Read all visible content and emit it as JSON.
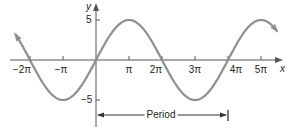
{
  "chart_data": {
    "type": "line",
    "title": "",
    "function": "y = 5 sin(x/2)",
    "xlabel": "x",
    "ylabel": "y",
    "x_ticks": [
      "-2π",
      "-π",
      "π",
      "2π",
      "3π",
      "4π",
      "5π"
    ],
    "x_tick_values_in_pi": [
      -2,
      -1,
      1,
      2,
      3,
      4,
      5
    ],
    "y_ticks": [
      "5",
      "-5"
    ],
    "y_tick_values": [
      5,
      -5
    ],
    "xlim_in_pi": [
      -2.5,
      5.6
    ],
    "ylim": [
      -7,
      7
    ],
    "amplitude": 5,
    "period_in_pi": 4,
    "series": [
      {
        "name": "5 sin(x/2)",
        "x_in_pi": [
          -2.4,
          -2,
          -1,
          0,
          1,
          2,
          3,
          4,
          5,
          5.5
        ],
        "y": [
          -1.5,
          0,
          -5,
          0,
          5,
          0,
          -5,
          0,
          5,
          3.5
        ]
      }
    ],
    "annotations": [
      {
        "text": "Period",
        "from_x_in_pi": 0,
        "to_x_in_pi": 4
      }
    ],
    "grid": false,
    "legend": null,
    "curve_color": "#8a8a8a",
    "axis_color": "#555555"
  },
  "labels": {
    "x_axis": "x",
    "y_axis": "y",
    "xt_m2pi": "−2π",
    "xt_mpi": "−π",
    "xt_pi": "π",
    "xt_2pi": "2π",
    "xt_3pi": "3π",
    "xt_4pi": "4π",
    "xt_5pi": "5π",
    "yt_5": "5",
    "yt_m5": "−5",
    "period": "Period"
  }
}
